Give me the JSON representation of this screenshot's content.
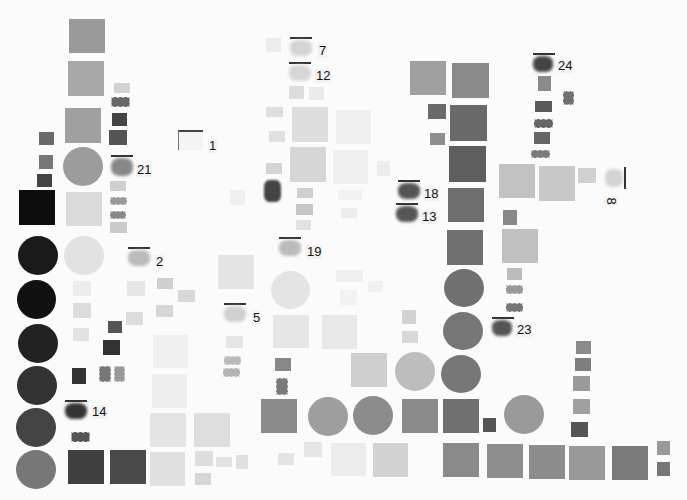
{
  "page": {
    "background": "#fbfbfb"
  },
  "labels": [
    {
      "id": "1",
      "text": "1"
    },
    {
      "id": "2",
      "text": "2"
    },
    {
      "id": "5",
      "text": "5"
    },
    {
      "id": "7",
      "text": "7"
    },
    {
      "id": "8",
      "text": "8"
    },
    {
      "id": "12",
      "text": "12"
    },
    {
      "id": "13",
      "text": "13"
    },
    {
      "id": "14",
      "text": "14"
    },
    {
      "id": "18",
      "text": "18"
    },
    {
      "id": "19",
      "text": "19"
    },
    {
      "id": "21",
      "text": "21"
    },
    {
      "id": "23",
      "text": "23"
    },
    {
      "id": "24",
      "text": "24"
    }
  ],
  "colors": {
    "black": "#0d0d0d",
    "very_dark": "#2a2a2a",
    "dark": "#555555",
    "mid_dark": "#707070",
    "mid": "#8a8a8a",
    "mid_light": "#a6a6a6",
    "light": "#c4c4c4",
    "very_light": "#dedede",
    "faint": "#ececec"
  }
}
